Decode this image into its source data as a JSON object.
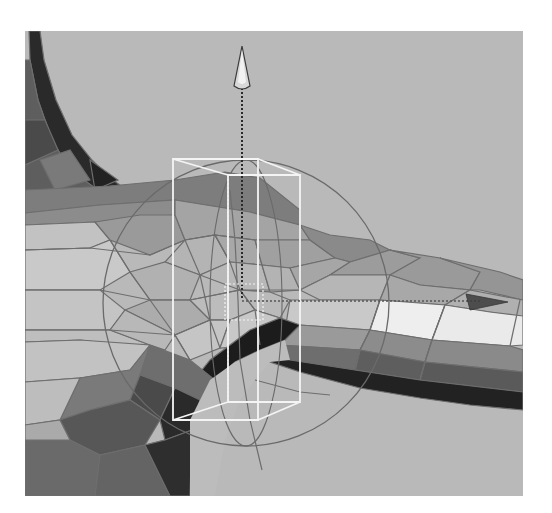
{
  "viewport": {
    "background": "#b9b9b9",
    "frame": {
      "x": 25,
      "y": 31,
      "width": 498,
      "height": 465
    },
    "grid_line_color": "#6e6e6e",
    "manipulator_color": "#f4f4f4"
  },
  "mesh": {
    "shades": {
      "black": "#1e1e1e",
      "dark": "#3a3a3a",
      "darkmid": "#5a5a5a",
      "mid": "#7e7e7e",
      "midlight": "#999999",
      "light": "#b0b0b0",
      "pale": "#c6c6c6",
      "white": "#ececec"
    }
  },
  "manipulator": {
    "type": "translate",
    "up_arrow_icon": "arrow-up-icon",
    "right_arrow_icon": "arrow-right-icon",
    "pivot": {
      "x": 242,
      "y": 301
    }
  }
}
